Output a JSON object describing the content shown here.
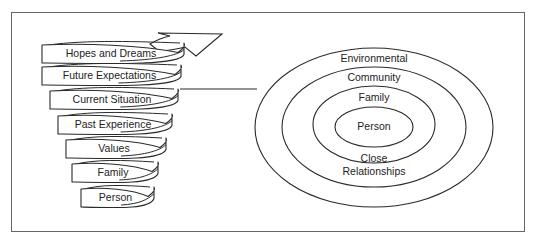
{
  "colors": {
    "background": "#ffffff",
    "stroke": "#2a2a2a",
    "frame": "#555555",
    "text": "#222222"
  },
  "spiral": {
    "direction_icon": "arrow-up-right-icon",
    "ribbons": [
      {
        "label": "Hopes and Dreams",
        "x": 42,
        "y": 44,
        "w": 142,
        "h": 19
      },
      {
        "label": "Future Expectations",
        "x": 42,
        "y": 66,
        "w": 139,
        "h": 19
      },
      {
        "label": "Current Situation",
        "x": 50,
        "y": 90,
        "w": 128,
        "h": 19
      },
      {
        "label": "Past Experience",
        "x": 58,
        "y": 115,
        "w": 114,
        "h": 19
      },
      {
        "label": "Values",
        "x": 66,
        "y": 139,
        "w": 100,
        "h": 19
      },
      {
        "label": "Family",
        "x": 72,
        "y": 163,
        "w": 86,
        "h": 19
      },
      {
        "label": "Person",
        "x": 81,
        "y": 188,
        "w": 73,
        "h": 19
      }
    ]
  },
  "connector": {
    "x1": 180,
    "y1": 89,
    "x2": 257,
    "y2": 89
  },
  "rings": {
    "cx": 374,
    "ellipses": [
      {
        "name": "environmental",
        "rx": 119,
        "top": 48,
        "bottom": 207
      },
      {
        "name": "community",
        "rx": 92,
        "top": 67,
        "bottom": 187
      },
      {
        "name": "family",
        "rx": 61,
        "top": 86,
        "bottom": 163
      },
      {
        "name": "person",
        "rx": 39,
        "top": 107,
        "bottom": 147
      }
    ],
    "labels": [
      {
        "key": "environmental",
        "text": "Environmental",
        "x": 374,
        "y": 62
      },
      {
        "key": "community",
        "text": "Community",
        "x": 374,
        "y": 81
      },
      {
        "key": "family",
        "text": "Family",
        "x": 374,
        "y": 101
      },
      {
        "key": "person",
        "text": "Person",
        "x": 374,
        "y": 130
      },
      {
        "key": "close",
        "text": "Close",
        "x": 374,
        "y": 162
      },
      {
        "key": "relationships",
        "text": "Relationships",
        "x": 374,
        "y": 175
      }
    ]
  }
}
